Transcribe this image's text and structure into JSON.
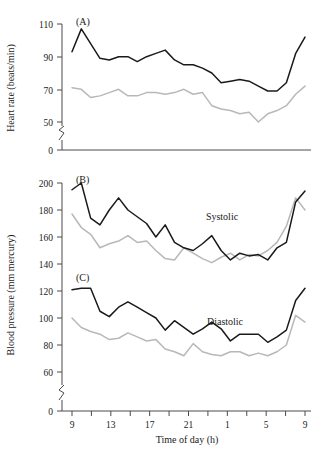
{
  "figure": {
    "width": 322,
    "height": 451,
    "background": "#ffffff"
  },
  "colors": {
    "series_dark": "#1a1a1a",
    "series_light": "#b8b8b8",
    "axis": "#4a4a4a",
    "text": "#1a1a1a"
  },
  "chart_data": [
    {
      "type": "line",
      "panel": "A",
      "panel_label": "(A)",
      "title": "",
      "xlabel": "",
      "ylabel": "Heart rate (beats/min)",
      "ylim": [
        0,
        110
      ],
      "y_ticks": [
        0,
        50,
        70,
        90,
        110
      ],
      "y_tick_labels": [
        "0",
        "50",
        "70",
        "90",
        "110"
      ],
      "y_axis_break": true,
      "x": [
        9,
        10,
        11,
        12,
        13,
        14,
        15,
        16,
        17,
        18,
        19,
        20,
        21,
        22,
        23,
        0,
        1,
        2,
        3,
        4,
        5,
        6,
        7,
        8
      ],
      "x_ticks": [
        9,
        11,
        13,
        15,
        17,
        19,
        21,
        23,
        1,
        3,
        5,
        7,
        9
      ],
      "x_tick_labels": [
        "9",
        "",
        "13",
        "",
        "17",
        "",
        "21",
        "",
        "1",
        "",
        "5",
        "",
        "9"
      ],
      "xlim": [
        9,
        33
      ],
      "grid": false,
      "legend": "none",
      "series": [
        {
          "name": "dark",
          "values": [
            93,
            107,
            98,
            89,
            88,
            90,
            90,
            87,
            90,
            92,
            94,
            88,
            85,
            85,
            83,
            80,
            74,
            75,
            76,
            75,
            72,
            69,
            69,
            74,
            92,
            102
          ]
        },
        {
          "name": "light",
          "values": [
            71,
            70,
            65,
            66,
            68,
            70,
            66,
            66,
            68,
            68,
            67,
            68,
            70,
            67,
            68,
            60,
            58,
            57,
            55,
            56,
            50,
            55,
            57,
            60,
            67,
            72
          ]
        }
      ]
    },
    {
      "type": "line",
      "panel": "B",
      "panel_label": "(B)",
      "annotation": "Systolic",
      "title": "",
      "xlabel": "",
      "ylabel": "Blood pressure (mm mercury)",
      "ylim": [
        0,
        200
      ],
      "y_ticks": [
        0,
        60,
        80,
        100,
        120,
        140,
        160,
        180,
        200
      ],
      "y_tick_labels": [
        "0",
        "60",
        "80",
        "100",
        "120",
        "140",
        "160",
        "180",
        "200"
      ],
      "y_axis_break": true,
      "x": [
        9,
        10,
        11,
        12,
        13,
        14,
        15,
        16,
        17,
        18,
        19,
        20,
        21,
        22,
        23,
        0,
        1,
        2,
        3,
        4,
        5,
        6,
        7,
        8
      ],
      "xlim": [
        9,
        33
      ],
      "grid": false,
      "legend": "none",
      "series": [
        {
          "name": "dark",
          "values": [
            195,
            200,
            174,
            169,
            180,
            189,
            180,
            175,
            170,
            160,
            169,
            156,
            152,
            150,
            155,
            161,
            150,
            143,
            148,
            146,
            147,
            143,
            152,
            156,
            186,
            194
          ]
        },
        {
          "name": "light",
          "values": [
            177,
            167,
            162,
            152,
            155,
            157,
            161,
            156,
            157,
            150,
            144,
            143,
            152,
            148,
            144,
            141,
            145,
            148,
            143,
            147,
            146,
            150,
            156,
            168,
            189,
            180
          ]
        }
      ]
    },
    {
      "type": "line",
      "panel": "C",
      "panel_label": "(C)",
      "annotation": "Diastolic",
      "title": "",
      "xlabel": "Time of day (h)",
      "ylabel": "Blood pressure (mm mercury)",
      "ylim": [
        0,
        130
      ],
      "y_ticks": [
        0,
        60,
        80,
        100,
        120
      ],
      "y_tick_labels": [
        "0",
        "60",
        "80",
        "100",
        "120"
      ],
      "y_axis_break": true,
      "x": [
        9,
        10,
        11,
        12,
        13,
        14,
        15,
        16,
        17,
        18,
        19,
        20,
        21,
        22,
        23,
        0,
        1,
        2,
        3,
        4,
        5,
        6,
        7,
        8
      ],
      "x_ticks": [
        9,
        11,
        13,
        15,
        17,
        19,
        21,
        23,
        1,
        3,
        5,
        7,
        9
      ],
      "x_tick_labels": [
        "9",
        "",
        "13",
        "",
        "17",
        "",
        "21",
        "",
        "1",
        "",
        "5",
        "",
        "9"
      ],
      "xlim": [
        9,
        33
      ],
      "grid": false,
      "legend": "none",
      "series": [
        {
          "name": "dark",
          "values": [
            121,
            122,
            122,
            105,
            101,
            108,
            112,
            108,
            104,
            100,
            91,
            98,
            93,
            88,
            92,
            97,
            92,
            83,
            88,
            88,
            88,
            82,
            86,
            91,
            113,
            122
          ]
        },
        {
          "name": "light",
          "values": [
            100,
            93,
            90,
            88,
            84,
            85,
            89,
            86,
            83,
            84,
            77,
            75,
            72,
            81,
            75,
            73,
            72,
            75,
            75,
            72,
            74,
            72,
            75,
            80,
            102,
            97
          ]
        }
      ]
    }
  ],
  "axes": {
    "x_axis_label": "Time of day (h)",
    "x_tick_labels": [
      "9",
      "13",
      "17",
      "21",
      "1",
      "5",
      "9"
    ],
    "y_label_top": "Heart rate (beats/min)",
    "y_label_bottom": "Blood pressure (mm mercury)"
  },
  "panel_labels": {
    "a": "(A)",
    "b": "(B)",
    "c": "(C)"
  },
  "annotations": {
    "systolic": "Systolic",
    "diastolic": "Diastolic"
  },
  "y_ticks_top": [
    "110",
    "90",
    "70",
    "50",
    "0"
  ],
  "y_ticks_bottom": [
    "200",
    "180",
    "160",
    "140",
    "120",
    "100",
    "80",
    "60",
    "0"
  ]
}
